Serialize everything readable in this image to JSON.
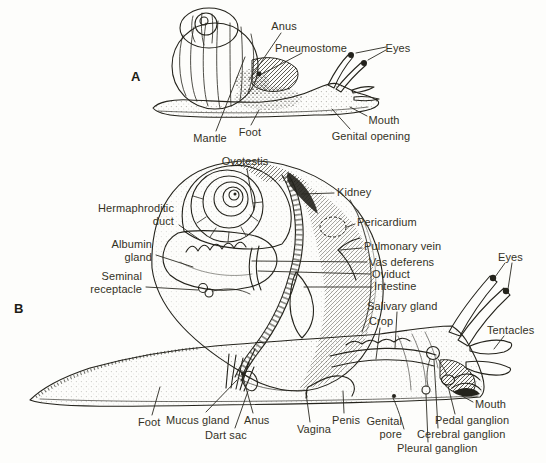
{
  "figure": {
    "type": "anatomical-line-drawing",
    "colors": {
      "ink": "#24231c",
      "label_text": "#34321f",
      "background": "#fdfdfb"
    }
  },
  "panelA": {
    "letter": "A",
    "labels": {
      "anus": "Anus",
      "pneumostome": "Pneumostome",
      "eyes": "Eyes",
      "mouth": "Mouth",
      "genital_opening": "Genital opening",
      "foot": "Foot",
      "mantle": "Mantle"
    }
  },
  "panelB": {
    "letter": "B",
    "labels": {
      "ovotestis": "Ovotestis",
      "hermaphroditic_duct": "Hermaphroditic duct",
      "albumin_gland": "Albumin gland",
      "seminal_receptacle": "Seminal receptacle",
      "kidney": "Kidney",
      "pericardium": "Pericardium",
      "pulmonary_vein": "Pulmonary vein",
      "vas_deferens": "Vas deferens",
      "oviduct": "Oviduct",
      "intestine": "Intestine",
      "eyes": "Eyes",
      "tentacles": "Tentacles",
      "salivary_gland": "Salivary gland",
      "crop": "Crop",
      "mouth": "Mouth",
      "pedal_ganglion": "Pedal ganglion",
      "cerebral_ganglion": "Cerebral ganglion",
      "pleural_ganglion": "Pleural ganglion",
      "genital_pore": "Genital pore",
      "penis": "Penis",
      "vagina": "Vagina",
      "anus": "Anus",
      "dart_sac": "Dart sac",
      "mucus_gland": "Mucus gland",
      "foot": "Foot"
    }
  }
}
